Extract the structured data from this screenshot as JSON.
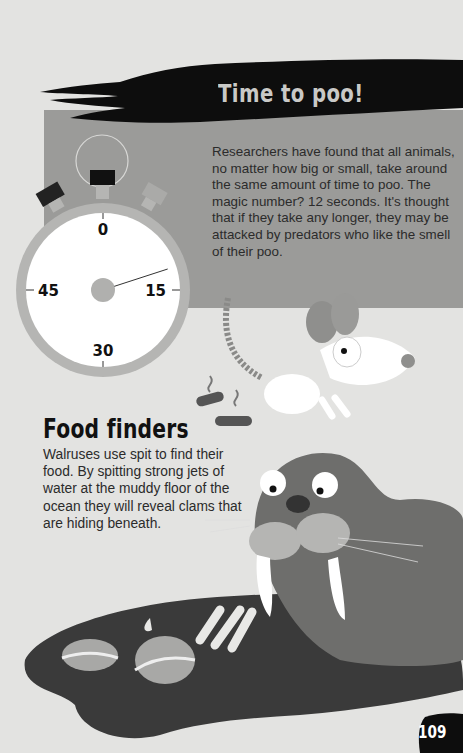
{
  "section1": {
    "title": "Time to poo!",
    "body": "Researchers have found that all animals, no matter how big or small, take around the same amount of time to poo. The magic number? 12 seconds. It's thought that if they take any longer, they may be attacked by predators who like the smell of their poo."
  },
  "stopwatch": {
    "labels": [
      "0",
      "15",
      "30",
      "45"
    ],
    "hand_seconds": 12
  },
  "section2": {
    "title": "Food finders",
    "body": "Walruses use spit to find their food. By spitting strong jets of water at the muddy floor of the ocean they will reveal clams that are hiding beneath."
  },
  "page_number": "109",
  "colors": {
    "background": "#e3e3e1",
    "panel": "#9b9b99",
    "banner": "#0d0d0d",
    "mud": "#3a3a3a",
    "walrus": "#6e6e6c"
  }
}
